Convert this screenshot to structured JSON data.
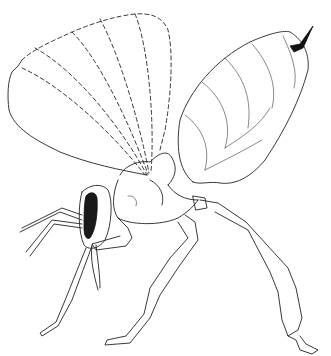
{
  "illustration": {
    "subject": "insect-line-drawing",
    "style": "black ink line art on white",
    "colors": {
      "background": "#ffffff",
      "ink": "#222222",
      "eye_fill": "#1a1a1a"
    },
    "parts": [
      "forewing",
      "wing-veins",
      "head",
      "compound-eye",
      "antennae",
      "thorax",
      "petiole",
      "abdomen",
      "ovipositor",
      "fore-leg",
      "mid-leg",
      "hind-leg"
    ]
  }
}
